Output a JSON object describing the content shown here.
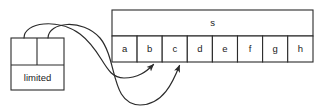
{
  "diagram": {
    "type": "pointer-to-array",
    "background_color": "#ffffff",
    "stroke_color": "#2b2b2b",
    "node": {
      "name": "limited-node",
      "label": "limited",
      "x": 11,
      "y": 38,
      "width": 53,
      "height": 52,
      "pointer_cells": [
        "",
        ""
      ],
      "divider_x": 37,
      "split_y": 65
    },
    "array": {
      "name": "array-s",
      "header_label": "s",
      "x": 112,
      "y": 10,
      "width": 201,
      "header_height": 26,
      "cell_height": 26,
      "cells": [
        {
          "label": "a"
        },
        {
          "label": "b"
        },
        {
          "label": "c"
        },
        {
          "label": "d"
        },
        {
          "label": "e"
        },
        {
          "label": "f"
        },
        {
          "label": "g"
        },
        {
          "label": "h"
        }
      ]
    },
    "arrows": [
      {
        "name": "pointer-arrow-1",
        "from_cell_index": 0,
        "to_cell_label": "b",
        "path": "M 24 38 C 24 22, 58 18, 80 34 C 104 52, 104 78, 124 78 C 138 78, 146 72, 153 65"
      },
      {
        "name": "pointer-arrow-2",
        "from_cell_index": 1,
        "to_cell_label": "c",
        "path": "M 48 38 C 48 22, 82 18, 100 38 C 118 60, 110 104, 140 105 C 162 105, 172 82, 179 66"
      }
    ]
  }
}
